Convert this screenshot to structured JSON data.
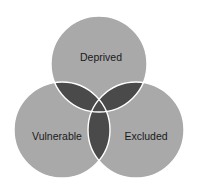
{
  "diagram": {
    "type": "venn",
    "sets": [
      {
        "label": "Deprived",
        "cx": 99,
        "cy": 64,
        "r": 48
      },
      {
        "label": "Vulnerable",
        "cx": 62,
        "cy": 130,
        "r": 48
      },
      {
        "label": "Excluded",
        "cx": 136,
        "cy": 130,
        "r": 48
      }
    ],
    "colors": {
      "circle_fill": "#a9a9a9",
      "overlap_fill": "#4a4a4a",
      "outline": "#ffffff"
    }
  }
}
